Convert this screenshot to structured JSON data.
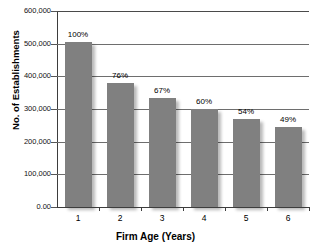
{
  "chart_data": {
    "type": "bar",
    "title": "",
    "xlabel": "Firm Age (Years)",
    "ylabel": "No. of Establishments",
    "categories": [
      "1",
      "2",
      "3",
      "4",
      "5",
      "6"
    ],
    "values": [
      505000,
      380000,
      335000,
      300000,
      270000,
      245000
    ],
    "data_labels": [
      "100%",
      "76%",
      "67%",
      "60%",
      "54%",
      "49%"
    ],
    "ylim": [
      0,
      600000
    ],
    "ytick_labels": [
      "600,000",
      "500,000",
      "400,000",
      "300,000",
      "200,000",
      "100,000",
      "0.00"
    ],
    "ytick_values": [
      600000,
      500000,
      400000,
      300000,
      200000,
      100000,
      0
    ],
    "grid": "horizontal",
    "legend": "none",
    "series": [
      {
        "name": "No. of Establishments",
        "values": [
          505000,
          380000,
          335000,
          300000,
          270000,
          245000
        ],
        "color": "#808080"
      }
    ]
  },
  "colors": {
    "bar": "#808080",
    "gridline": "#6e6e6e",
    "axis": "#3d3d3d",
    "background": "#ffffff",
    "text": "#000000"
  }
}
